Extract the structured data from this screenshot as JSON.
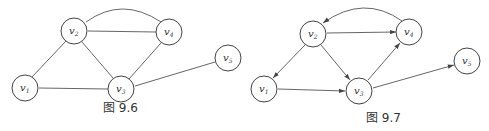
{
  "figures": [
    {
      "caption": "图 9.6",
      "directed": false,
      "nodes": [
        {
          "id": "v1",
          "base": "v",
          "sub": "1"
        },
        {
          "id": "v2",
          "base": "v",
          "sub": "2"
        },
        {
          "id": "v3",
          "base": "v",
          "sub": "3"
        },
        {
          "id": "v4",
          "base": "v",
          "sub": "4"
        },
        {
          "id": "v5",
          "base": "v",
          "sub": "5"
        }
      ],
      "edges": [
        [
          "v1",
          "v2"
        ],
        [
          "v1",
          "v3"
        ],
        [
          "v2",
          "v3"
        ],
        [
          "v2",
          "v4"
        ],
        [
          "v2",
          "v4"
        ],
        [
          "v3",
          "v4"
        ],
        [
          "v3",
          "v5"
        ]
      ]
    },
    {
      "caption": "图 9.7",
      "directed": true,
      "nodes": [
        {
          "id": "v1",
          "base": "v",
          "sub": "1"
        },
        {
          "id": "v2",
          "base": "v",
          "sub": "2"
        },
        {
          "id": "v3",
          "base": "v",
          "sub": "3"
        },
        {
          "id": "v4",
          "base": "v",
          "sub": "4"
        },
        {
          "id": "v5",
          "base": "v",
          "sub": "5"
        }
      ],
      "edges": [
        [
          "v2",
          "v1"
        ],
        [
          "v2",
          "v3"
        ],
        [
          "v2",
          "v4"
        ],
        [
          "v4",
          "v2"
        ],
        [
          "v1",
          "v3"
        ],
        [
          "v3",
          "v4"
        ],
        [
          "v3",
          "v5"
        ]
      ]
    }
  ]
}
